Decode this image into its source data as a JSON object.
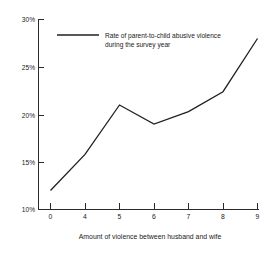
{
  "chart_data": {
    "type": "line",
    "title": "",
    "subtitle": "",
    "xlabel": "Amount of violence between husband and wife",
    "ylabel": "",
    "categories": [
      "0",
      "4",
      "5",
      "6",
      "7",
      "8",
      "9"
    ],
    "values": [
      12,
      15.8,
      21,
      19,
      20.3,
      22.4,
      28
    ],
    "series": [
      {
        "name": "Rate of parent-to-child abusive violence during the survey year",
        "values": [
          12,
          15.8,
          21,
          19,
          20.3,
          22.4,
          28
        ]
      }
    ],
    "ylim": [
      10,
      30
    ],
    "xlim": [
      0,
      6
    ],
    "yticks": [
      10,
      15,
      20,
      25,
      30
    ],
    "ytick_labels": [
      "10%",
      "15%",
      "20%",
      "25%",
      "30%"
    ],
    "xtick_labels": [
      "0",
      "4",
      "5",
      "6",
      "7",
      "8",
      "9"
    ],
    "grid": false,
    "legend_position": "top-center",
    "legend": [
      {
        "line_1": "Rate of parent-to-child abusive violence",
        "line_2": "during the survey year"
      }
    ],
    "colors": {
      "line": "#202020",
      "axis": "#2b2b2b",
      "background": "#ffffff",
      "text": "#1a1a1a"
    }
  }
}
